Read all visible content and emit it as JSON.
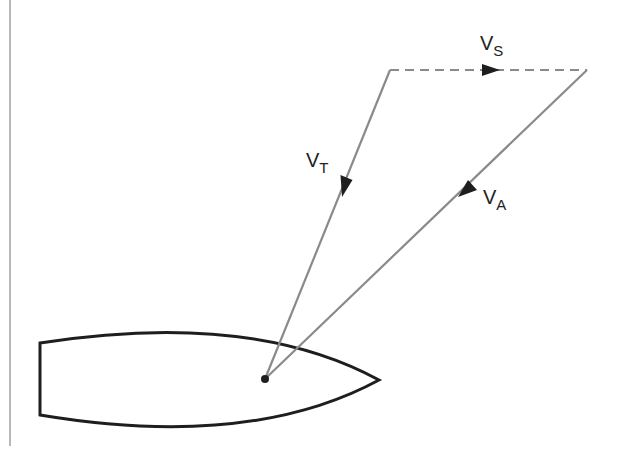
{
  "diagram": {
    "colors": {
      "vector_line": "#8a8a8a",
      "arrowhead": "#1e1e1e",
      "hull": "#1e1e1e",
      "border_line": "#a0a0a0",
      "background": "#ffffff"
    },
    "vectors": [
      {
        "id": "vs",
        "label_main": "V",
        "label_sub": "S",
        "style": "dashed",
        "from": [
          390,
          70
        ],
        "to": [
          587,
          70
        ]
      },
      {
        "id": "vt",
        "label_main": "V",
        "label_sub": "T",
        "style": "solid",
        "from": [
          390,
          70
        ],
        "to": [
          265,
          379
        ]
      },
      {
        "id": "va",
        "label_main": "V",
        "label_sub": "A",
        "style": "solid",
        "from": [
          587,
          70
        ],
        "to": [
          265,
          379
        ]
      }
    ],
    "labels": {
      "vs_main": "V",
      "vs_sub": "S",
      "vt_main": "V",
      "vt_sub": "T",
      "va_main": "V",
      "va_sub": "A"
    },
    "boat": {
      "shape": "hull outline (top view)",
      "reference_point": [
        265,
        379
      ]
    }
  }
}
